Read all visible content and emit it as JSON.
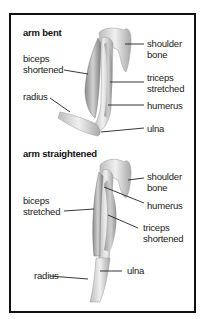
{
  "panels": [
    {
      "title": "arm bent",
      "labels": {
        "biceps": "biceps\nshortened",
        "radius": "radius",
        "shoulder": "shoulder\nbone",
        "triceps": "triceps\nstretched",
        "humerus": "humerus",
        "ulna": "ulna"
      }
    },
    {
      "title": "arm straightened",
      "labels": {
        "shoulder": "shoulder\nbone",
        "biceps": "biceps\nstretched",
        "humerus": "humerus",
        "triceps": "triceps\nshortened",
        "radius": "radius",
        "ulna": "ulna"
      }
    }
  ],
  "colors": {
    "border": "#111111",
    "bone": "#e4e4e4",
    "muscle": "#b5b5b5",
    "leader": "#222222"
  }
}
